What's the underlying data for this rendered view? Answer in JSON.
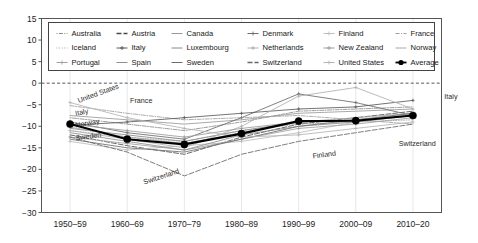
{
  "chart_data": {
    "type": "line",
    "title": "",
    "subtitle": "",
    "xlabel": "",
    "ylabel": "",
    "grid": false,
    "legend_position": "top-inside",
    "xlim_categories": 7,
    "ylim": [
      -30,
      15
    ],
    "yticks": [
      15,
      10,
      5,
      0,
      -5,
      -10,
      -15,
      -20,
      -25,
      -30
    ],
    "categories": [
      "1950–59",
      "1960–69",
      "1970–79",
      "1980–89",
      "1990–99",
      "2000–09",
      "2010–20"
    ],
    "zero_reference_line": 0,
    "series": [
      {
        "name": "Australia",
        "values": [
          -8.0,
          -9.5,
          -11.0,
          -9.0,
          -6.5,
          -6.0,
          -5.5
        ]
      },
      {
        "name": "Austria",
        "values": [
          -12.0,
          -14.5,
          -16.5,
          -12.5,
          -9.5,
          -8.0,
          -6.5
        ]
      },
      {
        "name": "Canada",
        "values": [
          -7.5,
          -8.5,
          -9.5,
          -8.5,
          -7.0,
          -6.5,
          -6.0
        ]
      },
      {
        "name": "Denmark",
        "values": [
          -9.0,
          -11.5,
          -13.0,
          -8.0,
          -2.5,
          -4.5,
          -7.5
        ]
      },
      {
        "name": "Finland",
        "values": [
          -13.5,
          -15.5,
          -14.5,
          -13.5,
          -11.5,
          -9.0,
          -7.0
        ]
      },
      {
        "name": "France",
        "values": [
          -5.2,
          -7.0,
          -8.5,
          -8.0,
          -7.5,
          -8.5,
          -9.5
        ]
      },
      {
        "name": "Iceland",
        "values": [
          -11.0,
          -12.5,
          -13.5,
          -11.0,
          -9.5,
          -9.0,
          -8.5
        ]
      },
      {
        "name": "Italy",
        "values": [
          -9.8,
          -9.0,
          -8.0,
          -7.0,
          -6.0,
          -5.5,
          -4.0
        ]
      },
      {
        "name": "Luxembourg",
        "values": [
          -10.5,
          -12.0,
          -13.5,
          -11.0,
          -9.0,
          -8.5,
          -7.5
        ]
      },
      {
        "name": "Netherlands",
        "values": [
          -11.0,
          -13.0,
          -15.0,
          -10.0,
          -3.0,
          -1.0,
          -6.0
        ]
      },
      {
        "name": "New Zealand",
        "values": [
          -9.5,
          -11.0,
          -12.5,
          -10.5,
          -9.0,
          -8.5,
          -7.5
        ]
      },
      {
        "name": "Norway",
        "values": [
          -10.2,
          -12.5,
          -14.0,
          -11.5,
          -9.0,
          -8.0,
          -7.0
        ]
      },
      {
        "name": "Portugal",
        "values": [
          -12.5,
          -14.0,
          -15.5,
          -13.0,
          -10.5,
          -9.5,
          -8.0
        ]
      },
      {
        "name": "Spain",
        "values": [
          -11.5,
          -13.5,
          -15.5,
          -12.0,
          -10.0,
          -9.0,
          -7.5
        ]
      },
      {
        "name": "Sweden",
        "values": [
          -13.0,
          -15.0,
          -16.0,
          -13.0,
          -10.0,
          -8.5,
          -7.0
        ]
      },
      {
        "name": "Switzerland",
        "values": [
          -12.5,
          -16.0,
          -21.5,
          -16.5,
          -13.5,
          -11.5,
          -9.5
        ]
      },
      {
        "name": "United States",
        "values": [
          -4.5,
          -8.0,
          -10.5,
          -12.5,
          -12.0,
          -10.5,
          -9.0
        ]
      },
      {
        "name": "Average",
        "values": [
          -9.5,
          -13.0,
          -14.2,
          -11.7,
          -8.8,
          -8.7,
          -7.5
        ],
        "emphasis": true
      }
    ],
    "annotations": [
      {
        "text": "United States",
        "x": 0.15,
        "y": -4.6,
        "rotate": -20
      },
      {
        "text": "France",
        "x": 1.05,
        "y": -4.6,
        "rotate": 0
      },
      {
        "text": "Italy",
        "x": 0.1,
        "y": -7.6,
        "rotate": -12
      },
      {
        "text": "Norway",
        "x": 0.1,
        "y": -10.3,
        "rotate": -10
      },
      {
        "text": "Sweden",
        "x": 0.1,
        "y": -13.3,
        "rotate": -8
      },
      {
        "text": "Switzerland",
        "x": 1.3,
        "y": -23.5,
        "rotate": -18
      },
      {
        "text": "Finland",
        "x": 4.25,
        "y": -17.5,
        "rotate": -8
      },
      {
        "text": "Switzerland",
        "x": 5.75,
        "y": -14.5,
        "rotate": 0
      },
      {
        "text": "Italy",
        "x": 6.55,
        "y": -3.6,
        "rotate": 0
      }
    ],
    "legend": {
      "columns": 6,
      "rows": 3,
      "entries": [
        {
          "label": "Australia",
          "marker": "dot-dash-dot",
          "color": "#8c8c8c"
        },
        {
          "label": "Austria",
          "marker": "thick-dash",
          "color": "#4a4a4a"
        },
        {
          "label": "Canada",
          "marker": "solid",
          "color": "#9a9a9a"
        },
        {
          "label": "Denmark",
          "marker": "plus-line",
          "color": "#6b6b6b"
        },
        {
          "label": "Finland",
          "marker": "arrow-line",
          "color": "#bcbcbc"
        },
        {
          "label": "France",
          "marker": "dash-dot",
          "color": "#9e9e9e"
        },
        {
          "label": "Iceland",
          "marker": "dotted",
          "color": "#a6a6a6"
        },
        {
          "label": "Italy",
          "marker": "star-line",
          "color": "#5a5a5a"
        },
        {
          "label": "Luxembourg",
          "marker": "solid",
          "color": "#8a8a8a"
        },
        {
          "label": "Netherlands",
          "marker": "plus-line",
          "color": "#b0b0b0"
        },
        {
          "label": "New Zealand",
          "marker": "star-line",
          "color": "#9c9c9c"
        },
        {
          "label": "Norway",
          "marker": "solid",
          "color": "#a8a8a8"
        },
        {
          "label": "Portugal",
          "marker": "star-line",
          "color": "#a0a0a0"
        },
        {
          "label": "Spain",
          "marker": "solid",
          "color": "#8e8e8e"
        },
        {
          "label": "Sweden",
          "marker": "solid",
          "color": "#6e6e6e"
        },
        {
          "label": "Switzerland",
          "marker": "thick-dash",
          "color": "#676767"
        },
        {
          "label": "United States",
          "marker": "arrow-line",
          "color": "#b4b4b4"
        },
        {
          "label": "Average",
          "marker": "bold-dot",
          "color": "#000000"
        }
      ]
    }
  }
}
